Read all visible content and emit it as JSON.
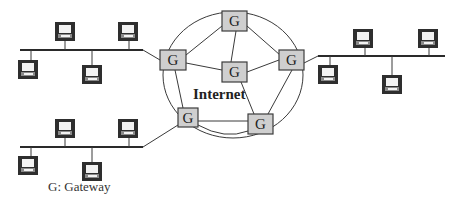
{
  "diagram": {
    "center_label": "Internet",
    "legend": "G: Gateway",
    "gateway_label": "G",
    "colors": {
      "gateway_fill": "#cfcfcf",
      "gateway_stroke": "#3c3c3c",
      "computer_frame": "#2e2e2e",
      "line": "#3a3a3a"
    },
    "gateways": [
      {
        "id": "top",
        "label": "G",
        "x": 222,
        "y": 11
      },
      {
        "id": "left",
        "label": "G",
        "x": 160,
        "y": 50
      },
      {
        "id": "center",
        "label": "G",
        "x": 222,
        "y": 62
      },
      {
        "id": "right",
        "label": "G",
        "x": 279,
        "y": 50
      },
      {
        "id": "bottom-left",
        "label": "G",
        "x": 178,
        "y": 108
      },
      {
        "id": "bottom-right",
        "label": "G",
        "x": 248,
        "y": 114
      }
    ],
    "lans": [
      {
        "id": "lan-top-left",
        "computers": 4,
        "connected_gateway": "left"
      },
      {
        "id": "lan-bottom-left",
        "computers": 4,
        "connected_gateway": "bottom-left"
      },
      {
        "id": "lan-right",
        "computers": 4,
        "connected_gateway": "right"
      }
    ]
  }
}
